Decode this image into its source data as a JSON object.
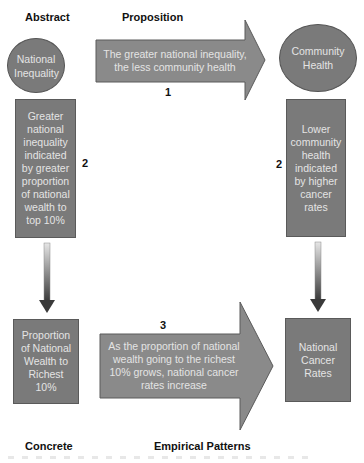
{
  "diagram": {
    "title_labels": {
      "top_left": "Abstract",
      "top_center": "Proposition",
      "bottom_left": "Concrete",
      "bottom_center": "Empirical Patterns"
    },
    "nodes": {
      "national_inequality": "National Inequality",
      "community_health": "Community Health",
      "indicator_left": "Greater national inequality indicated by greater proportion of national wealth to top 10%",
      "indicator_right": "Lower community health indicated by higher cancer rates",
      "measure_left": "Proportion of National Wealth to Richest 10%",
      "measure_right": "National Cancer Rates"
    },
    "arrows": {
      "proposition": {
        "number": "1",
        "text": "The greater national inequality, the less community health"
      },
      "operationalization_left": {
        "number": "2"
      },
      "operationalization_right": {
        "number": "2"
      },
      "empirical": {
        "number": "3",
        "text": "As the proportion of national wealth going to the richest 10% grows, national cancer rates increase"
      }
    },
    "colors": {
      "shape_fill": "#7a7a7a",
      "shape_border": "#555555",
      "shape_text": "#e4e4e4",
      "arrow_fill": "#8a8a8a",
      "label_text": "#111111"
    }
  }
}
